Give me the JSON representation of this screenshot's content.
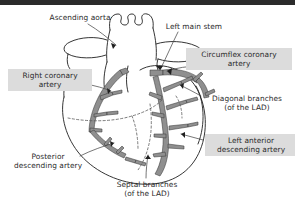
{
  "figure": {
    "view": "anterior"
  },
  "colors": {
    "background": "#ffffff",
    "top_band": "#2b2b2b",
    "vessel_fill": "#8f8f8f",
    "vessel_stroke": "#3a3a3a",
    "outline": "#1f1f1f",
    "label_box": "#dcdcdc",
    "label_text": "#2a2a2a",
    "leader_line": "#4a4a4a"
  },
  "labels": [
    {
      "id": "ascending-aorta",
      "text": "Ascending aorta",
      "boxed": false,
      "x": 44,
      "y": 13,
      "width": 72
    },
    {
      "id": "left-main-stem",
      "text": "Left main stem",
      "boxed": false,
      "x": 160,
      "y": 22,
      "width": 68
    },
    {
      "id": "circumflex-coronary-artery",
      "text": "Circumflex coronary\nartery",
      "boxed": true,
      "x": 186,
      "y": 48,
      "width": 98
    },
    {
      "id": "right-coronary-artery",
      "text": "Right coronary\nartery",
      "boxed": true,
      "x": 8,
      "y": 69,
      "width": 76
    },
    {
      "id": "diagonal-branches",
      "text": "Diagonal branches\n(of the LAD)",
      "boxed": false,
      "x": 203,
      "y": 94,
      "width": 88
    },
    {
      "id": "left-anterior-descending-artery",
      "text": "Left anterior\ndescending artery",
      "boxed": true,
      "x": 205,
      "y": 134,
      "width": 84
    },
    {
      "id": "posterior-descending-artery",
      "text": "Posterior\ndescending artery",
      "boxed": false,
      "x": 8,
      "y": 152,
      "width": 80
    },
    {
      "id": "septal-branches",
      "text": "Septal branches\n(of the LAD)",
      "boxed": false,
      "x": 106,
      "y": 180,
      "width": 82
    }
  ]
}
